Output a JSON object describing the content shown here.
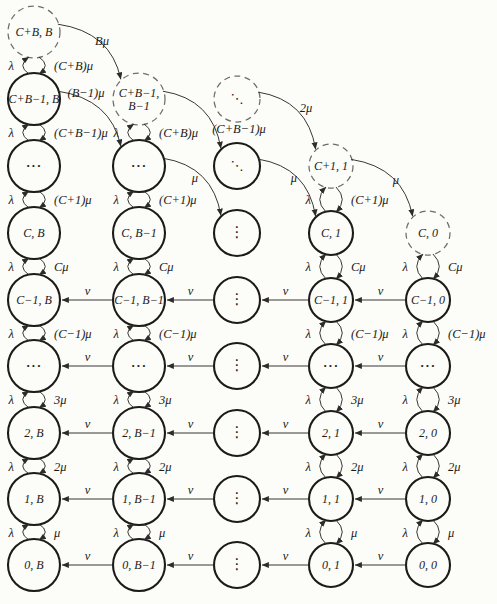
{
  "figure": {
    "name": "markov-chain-state-transition-diagram",
    "colors": {
      "background": "#fcfcf9",
      "solid_stroke": "#1c1b19",
      "dashed_stroke": "#6f6d69",
      "edge_stroke": "#2e2c2a",
      "text": "#1b1a18"
    },
    "geometry": {
      "width": 497,
      "height": 604,
      "columns_x": [
        34,
        139,
        237,
        331,
        428
      ],
      "rows_y": [
        32,
        99,
        166,
        233,
        300,
        366,
        433,
        499,
        565
      ],
      "radii": [
        26,
        26,
        23,
        22,
        22
      ]
    },
    "nodes": [
      {
        "c": 1,
        "r": 1,
        "t": "C+B, B",
        "d": true
      },
      {
        "c": 1,
        "r": 2,
        "t": "C+B−1, B"
      },
      {
        "c": 1,
        "r": 3,
        "t": "···",
        "k": "h"
      },
      {
        "c": 1,
        "r": 4,
        "t": "C, B"
      },
      {
        "c": 1,
        "r": 5,
        "t": "C−1, B"
      },
      {
        "c": 1,
        "r": 6,
        "t": "···",
        "k": "h"
      },
      {
        "c": 1,
        "r": 7,
        "t": "2, B"
      },
      {
        "c": 1,
        "r": 8,
        "t": "1, B"
      },
      {
        "c": 1,
        "r": 9,
        "t": "0, B"
      },
      {
        "c": 2,
        "r": 2,
        "t": [
          "C+B−1,",
          "B−1"
        ],
        "d": true
      },
      {
        "c": 2,
        "r": 3,
        "t": "···",
        "k": "h"
      },
      {
        "c": 2,
        "r": 4,
        "t": "C, B−1"
      },
      {
        "c": 2,
        "r": 5,
        "t": "C−1, B−1"
      },
      {
        "c": 2,
        "r": 6,
        "t": "···",
        "k": "h"
      },
      {
        "c": 2,
        "r": 7,
        "t": "2, B−1"
      },
      {
        "c": 2,
        "r": 8,
        "t": "1, B−1"
      },
      {
        "c": 2,
        "r": 9,
        "t": "0, B−1"
      },
      {
        "c": 3,
        "r": 2,
        "t": "⋱",
        "d": true,
        "k": "d"
      },
      {
        "c": 3,
        "r": 3,
        "t": "⋱",
        "k": "d"
      },
      {
        "c": 3,
        "r": 4,
        "t": "⋮",
        "k": "v"
      },
      {
        "c": 3,
        "r": 5,
        "t": "⋮",
        "k": "v"
      },
      {
        "c": 3,
        "r": 6,
        "t": "⋮",
        "k": "v"
      },
      {
        "c": 3,
        "r": 7,
        "t": "⋮",
        "k": "v"
      },
      {
        "c": 3,
        "r": 8,
        "t": "⋮",
        "k": "v"
      },
      {
        "c": 3,
        "r": 9,
        "t": "⋮",
        "k": "v"
      },
      {
        "c": 4,
        "r": 3,
        "t": "C+1, 1",
        "d": true
      },
      {
        "c": 4,
        "r": 4,
        "t": "C, 1"
      },
      {
        "c": 4,
        "r": 5,
        "t": "C−1, 1"
      },
      {
        "c": 4,
        "r": 6,
        "t": "···",
        "k": "h"
      },
      {
        "c": 4,
        "r": 7,
        "t": "2, 1"
      },
      {
        "c": 4,
        "r": 8,
        "t": "1, 1"
      },
      {
        "c": 4,
        "r": 9,
        "t": "0, 1"
      },
      {
        "c": 5,
        "r": 4,
        "t": "C, 0",
        "d": true
      },
      {
        "c": 5,
        "r": 5,
        "t": "C−1, 0"
      },
      {
        "c": 5,
        "r": 6,
        "t": "···",
        "k": "h"
      },
      {
        "c": 5,
        "r": 7,
        "t": "2, 0"
      },
      {
        "c": 5,
        "r": 8,
        "t": "1, 0"
      },
      {
        "c": 5,
        "r": 9,
        "t": "0, 0"
      }
    ],
    "rate_pairs": [
      {
        "c": 1,
        "r1": 1,
        "r2": 2,
        "up": "λ",
        "down": "(C+B)μ"
      },
      {
        "c": 1,
        "r1": 2,
        "r2": 3,
        "up": "λ",
        "down": "(C+B−1)μ"
      },
      {
        "c": 1,
        "r1": 3,
        "r2": 4,
        "up": "λ",
        "down": "(C+1)μ"
      },
      {
        "c": 1,
        "r1": 4,
        "r2": 5,
        "up": "λ",
        "down": "Cμ"
      },
      {
        "c": 1,
        "r1": 5,
        "r2": 6,
        "up": "λ",
        "down": "(C−1)μ"
      },
      {
        "c": 1,
        "r1": 6,
        "r2": 7,
        "up": "λ",
        "down": "3μ"
      },
      {
        "c": 1,
        "r1": 7,
        "r2": 8,
        "up": "λ",
        "down": "2μ"
      },
      {
        "c": 1,
        "r1": 8,
        "r2": 9,
        "up": "λ",
        "down": "μ"
      },
      {
        "c": 2,
        "r1": 2,
        "r2": 3,
        "up": "λ",
        "down": "(C+B)μ"
      },
      {
        "c": 2,
        "r1": 3,
        "r2": 4,
        "up": "λ",
        "down": "(C+1)μ"
      },
      {
        "c": 2,
        "r1": 4,
        "r2": 5,
        "up": "λ",
        "down": "Cμ"
      },
      {
        "c": 2,
        "r1": 5,
        "r2": 6,
        "up": "λ",
        "down": "(C−1)μ"
      },
      {
        "c": 2,
        "r1": 6,
        "r2": 7,
        "up": "λ",
        "down": "3μ"
      },
      {
        "c": 2,
        "r1": 7,
        "r2": 8,
        "up": "λ",
        "down": "2μ"
      },
      {
        "c": 2,
        "r1": 8,
        "r2": 9,
        "up": "λ",
        "down": "μ"
      },
      {
        "c": 4,
        "r1": 3,
        "r2": 4,
        "up": "λ",
        "down": "(C+1)μ"
      },
      {
        "c": 4,
        "r1": 4,
        "r2": 5,
        "up": "λ",
        "down": "Cμ"
      },
      {
        "c": 4,
        "r1": 5,
        "r2": 6,
        "up": "λ",
        "down": "(C−1)μ"
      },
      {
        "c": 4,
        "r1": 6,
        "r2": 7,
        "up": "λ",
        "down": "3μ"
      },
      {
        "c": 4,
        "r1": 7,
        "r2": 8,
        "up": "λ",
        "down": "2μ"
      },
      {
        "c": 4,
        "r1": 8,
        "r2": 9,
        "up": "λ",
        "down": "μ"
      },
      {
        "c": 5,
        "r1": 4,
        "r2": 5,
        "up": "λ",
        "down": "Cμ"
      },
      {
        "c": 5,
        "r1": 5,
        "r2": 6,
        "up": "λ",
        "down": "(C−1)μ"
      },
      {
        "c": 5,
        "r1": 6,
        "r2": 7,
        "up": "λ",
        "down": "3μ"
      },
      {
        "c": 5,
        "r1": 7,
        "r2": 8,
        "up": "λ",
        "down": "2μ"
      },
      {
        "c": 5,
        "r1": 8,
        "r2": 9,
        "up": "λ",
        "down": "μ"
      }
    ],
    "retrial_arrows": {
      "label": "ν",
      "rows": [
        5,
        6,
        7,
        8,
        9
      ],
      "direction": "left"
    },
    "diagonal_arrows": [
      {
        "f": [
          1,
          1
        ],
        "t": [
          2,
          2
        ],
        "l": "Bμ",
        "lx": 102,
        "ly": 45
      },
      {
        "f": [
          1,
          2
        ],
        "t": [
          2,
          3
        ],
        "l": "(B−1)μ",
        "lx": 86,
        "ly": 97
      },
      {
        "f": [
          2,
          2
        ],
        "t": [
          3,
          3
        ],
        "l": "(C+B−1)μ",
        "lx": 239,
        "ly": 133
      },
      {
        "f": [
          2,
          3
        ],
        "t": [
          3,
          4
        ],
        "l": "μ",
        "lx": 195,
        "ly": 182
      },
      {
        "f": [
          3,
          2
        ],
        "t": [
          4,
          3
        ],
        "l": "2μ",
        "lx": 306,
        "ly": 112
      },
      {
        "f": [
          3,
          3
        ],
        "t": [
          4,
          4
        ],
        "l": "μ",
        "lx": 294,
        "ly": 182
      },
      {
        "f": [
          4,
          3
        ],
        "t": [
          5,
          4
        ],
        "l": "μ",
        "lx": 396,
        "ly": 184
      }
    ]
  }
}
